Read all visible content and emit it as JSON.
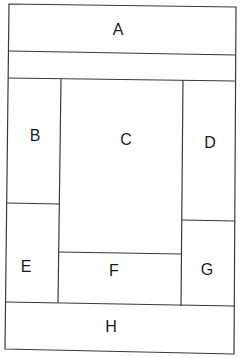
{
  "diagram": {
    "title": "",
    "regions": [
      {
        "id": "A",
        "label": "A"
      },
      {
        "id": "B",
        "label": "B"
      },
      {
        "id": "C",
        "label": "C"
      },
      {
        "id": "D",
        "label": "D"
      },
      {
        "id": "E",
        "label": "E"
      },
      {
        "id": "F",
        "label": "F"
      },
      {
        "id": "G",
        "label": "G"
      },
      {
        "id": "H",
        "label": "H"
      }
    ],
    "line_color": "#3a3a3a",
    "background": "#ffffff"
  }
}
